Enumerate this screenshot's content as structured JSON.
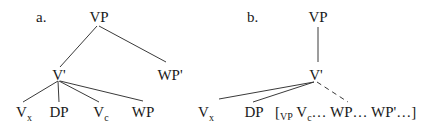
{
  "tree_a": {
    "label": "a.",
    "root": "VP",
    "bar": "V'",
    "right": "WP'",
    "leaves": [
      {
        "base": "V",
        "sub": "x"
      },
      {
        "base": "DP",
        "sub": ""
      },
      {
        "base": "V",
        "sub": "c"
      },
      {
        "base": "WP",
        "sub": ""
      }
    ]
  },
  "tree_b": {
    "label": "b.",
    "root": "VP",
    "bar": "V'",
    "leaves": [
      {
        "base": "V",
        "sub": "x"
      },
      {
        "base": "DP",
        "sub": ""
      }
    ],
    "bracket": {
      "open": "[",
      "cat": "VP",
      "v_base": "V",
      "v_sub": "c",
      "rest": "… WP… WP'…]"
    }
  },
  "colors": {
    "line": "#3a3a3a",
    "text": "#1a1a1a",
    "background": "#ffffff"
  }
}
